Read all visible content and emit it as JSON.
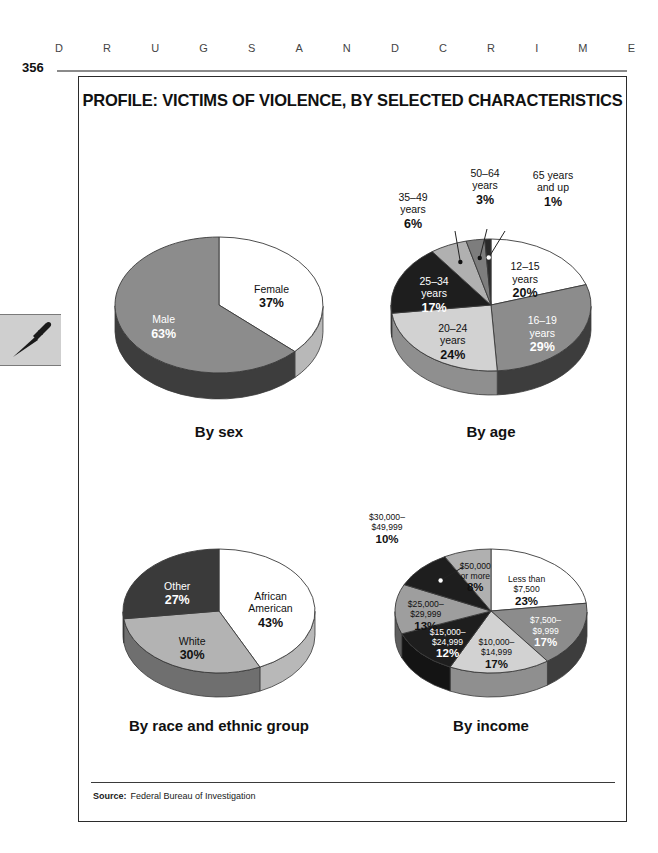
{
  "running_head": {
    "letters": [
      "D",
      "R",
      "U",
      "G",
      "S",
      "A",
      "N",
      "D",
      "C",
      "R",
      "I",
      "M",
      "E"
    ],
    "text": "DRUGS AND CRIME"
  },
  "folio": {
    "page_number": "356"
  },
  "margin_tab": {
    "icon": "dagger-icon"
  },
  "figure": {
    "title": "PROFILE: VICTIMS OF VIOLENCE, BY SELECTED CHARACTERISTICS",
    "source_label": "Source:",
    "source_text": "Federal Bureau of Investigation"
  },
  "palette": {
    "white": "#ffffff",
    "light_gray": "#c9c9c9",
    "mid_gray": "#8c8c8c",
    "dark_gray": "#5a5a5a",
    "near_black": "#1e1e1e",
    "edge": "#3a3a3a",
    "depth_white": "#b8b8b8",
    "depth_light": "#8f8f8f",
    "depth_mid": "#5e5e5e",
    "depth_dark": "#3d3d3d",
    "depth_black": "#141414"
  },
  "chart_data": [
    {
      "id": "by-sex",
      "type": "pie",
      "title": "By sex",
      "start_angle": 0,
      "categories": [
        "Female",
        "Male"
      ],
      "values": [
        37,
        63
      ],
      "labels": [
        {
          "name": "Female",
          "pct": "37%",
          "fill": "#ffffff",
          "depth": "#b8b8b8",
          "text": "#111111"
        },
        {
          "name": "Male",
          "pct": "63%",
          "fill": "#8c8c8c",
          "depth": "#3d3d3d",
          "text": "#ffffff"
        }
      ]
    },
    {
      "id": "by-age",
      "type": "pie",
      "title": "By age",
      "start_angle": 0,
      "categories": [
        "12–15 years",
        "16–19 years",
        "20–24 years",
        "25–34 years",
        "35–49 years",
        "50–64 years",
        "65 years and up"
      ],
      "values": [
        20,
        29,
        24,
        17,
        6,
        3,
        1
      ],
      "labels": [
        {
          "name": "12–15\nyears",
          "pct": "20%",
          "fill": "#ffffff",
          "depth": "#b8b8b8",
          "text": "#111111"
        },
        {
          "name": "16–19\nyears",
          "pct": "29%",
          "fill": "#8c8c8c",
          "depth": "#3d3d3d",
          "text": "#ffffff"
        },
        {
          "name": "20–24\nyears",
          "pct": "24%",
          "fill": "#d2d2d2",
          "depth": "#8f8f8f",
          "text": "#111111"
        },
        {
          "name": "25–34\nyears",
          "pct": "17%",
          "fill": "#1e1e1e",
          "depth": "#141414",
          "text": "#ffffff"
        },
        {
          "name": "35–49\nyears",
          "pct": "6%",
          "fill": "#b0b0b0",
          "depth": "#7a7a7a",
          "text": "#111111"
        },
        {
          "name": "50–64\nyears",
          "pct": "3%",
          "fill": "#7d7d7d",
          "depth": "#4a4a4a",
          "text": "#111111"
        },
        {
          "name": "65 years\nand up",
          "pct": "1%",
          "fill": "#2a2a2a",
          "depth": "#161616",
          "text": "#111111"
        }
      ]
    },
    {
      "id": "by-race",
      "type": "pie",
      "title": "By race and ethnic group",
      "start_angle": 0,
      "categories": [
        "African American",
        "White",
        "Other"
      ],
      "values": [
        43,
        30,
        27
      ],
      "labels": [
        {
          "name": "African\nAmerican",
          "pct": "43%",
          "fill": "#ffffff",
          "depth": "#b8b8b8",
          "text": "#111111"
        },
        {
          "name": "White",
          "pct": "30%",
          "fill": "#b3b3b3",
          "depth": "#6f6f6f",
          "text": "#111111"
        },
        {
          "name": "Other",
          "pct": "27%",
          "fill": "#3a3a3a",
          "depth": "#1c1c1c",
          "text": "#ffffff"
        }
      ]
    },
    {
      "id": "by-income",
      "type": "pie",
      "title": "By income",
      "start_angle": 0,
      "categories": [
        "Less than $7,500",
        "$7,500–$9,999",
        "$10,000–$14,999",
        "$15,000–$24,999",
        "$25,000–$29,999",
        "$30,000–$49,999",
        "$50,000 or more"
      ],
      "values": [
        23,
        17,
        17,
        12,
        13,
        10,
        8
      ],
      "labels": [
        {
          "name": "Less than\n$7,500",
          "pct": "23%",
          "fill": "#ffffff",
          "depth": "#b8b8b8",
          "text": "#111111"
        },
        {
          "name": "$7,500–\n$9,999",
          "pct": "17%",
          "fill": "#8c8c8c",
          "depth": "#3d3d3d",
          "text": "#ffffff"
        },
        {
          "name": "$10,000–\n$14,999",
          "pct": "17%",
          "fill": "#d2d2d2",
          "depth": "#8f8f8f",
          "text": "#111111"
        },
        {
          "name": "$15,000–\n$24,999",
          "pct": "12%",
          "fill": "#1e1e1e",
          "depth": "#141414",
          "text": "#ffffff"
        },
        {
          "name": "$25,000–\n$29,999",
          "pct": "13%",
          "fill": "#9e9e9e",
          "depth": "#5e5e5e",
          "text": "#111111"
        },
        {
          "name": "$30,000–\n$49,999",
          "pct": "10%",
          "fill": "#1e1e1e",
          "depth": "#141414",
          "text": "#111111"
        },
        {
          "name": "$50,000\nor more",
          "pct": "8%",
          "fill": "#b0b0b0",
          "depth": "#6f6f6f",
          "text": "#111111"
        }
      ]
    }
  ]
}
